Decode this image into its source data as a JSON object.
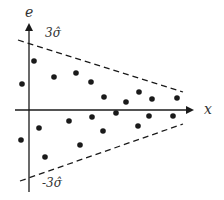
{
  "diagram": {
    "y_axis_label": "e",
    "x_axis_label": "x",
    "upper_bound_label": "3σ̂",
    "lower_bound_label": "-3σ̂",
    "colors": {
      "ink": "#1a1a1a",
      "text": "#333333",
      "background": "#ffffff"
    }
  },
  "chart_data": {
    "type": "scatter",
    "title": "",
    "xlabel": "x",
    "ylabel": "e",
    "annotations": [
      "3σ̂",
      "-3σ̂"
    ],
    "bounds": {
      "upper": {
        "from": [
          18,
          40
        ],
        "to": [
          183,
          92
        ],
        "style": "dashed"
      },
      "lower": {
        "from": [
          20,
          181
        ],
        "to": [
          183,
          124
        ],
        "style": "dashed"
      }
    },
    "points_px": [
      [
        34,
        61
      ],
      [
        22,
        84
      ],
      [
        54,
        77
      ],
      [
        76,
        73
      ],
      [
        91,
        82
      ],
      [
        104,
        97
      ],
      [
        126,
        102
      ],
      [
        139,
        92
      ],
      [
        152,
        99
      ],
      [
        177,
        98
      ],
      [
        21,
        140
      ],
      [
        39,
        128
      ],
      [
        45,
        157
      ],
      [
        69,
        121
      ],
      [
        80,
        145
      ],
      [
        92,
        117
      ],
      [
        103,
        131
      ],
      [
        116,
        113
      ],
      [
        138,
        126
      ],
      [
        149,
        116
      ],
      [
        173,
        116
      ]
    ],
    "grid": false,
    "legend": null
  }
}
